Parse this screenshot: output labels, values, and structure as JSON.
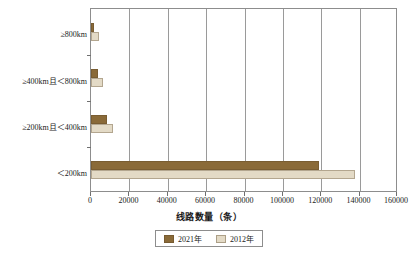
{
  "chart_data": {
    "type": "bar",
    "orientation": "horizontal",
    "title": "",
    "xlabel": "线路数量（条）",
    "ylabel": "",
    "xlim": [
      0,
      160000
    ],
    "xticks": [
      "0",
      "20000",
      "40000",
      "60000",
      "80000",
      "100000",
      "120000",
      "140000",
      "160000"
    ],
    "xtick_values": [
      0,
      20000,
      40000,
      60000,
      80000,
      100000,
      120000,
      140000,
      160000
    ],
    "grid": "vertical",
    "legend_position": "bottom-center",
    "categories": [
      "≥800km",
      "≥400km且＜800km",
      "≥200km且＜400km",
      "＜200km"
    ],
    "series": [
      {
        "name": "2021年",
        "color": "#8a6a38",
        "values": [
          1600,
          3600,
          8300,
          119000
        ]
      },
      {
        "name": "2012年",
        "color": "#e3dac6",
        "values": [
          4200,
          6300,
          11400,
          138000
        ]
      }
    ]
  },
  "axis": {
    "x_title": "线路数量（条）",
    "tick_labels": [
      "0",
      "20000",
      "40000",
      "60000",
      "80000",
      "100000",
      "120000",
      "140000",
      "160000"
    ],
    "category_labels": [
      "≥800km",
      "≥400km且＜800km",
      "≥200km且＜400km",
      "＜200km"
    ]
  },
  "legend": {
    "items": [
      {
        "label": "2021年",
        "color": "#8a6a38"
      },
      {
        "label": "2012年",
        "color": "#e3dac6"
      }
    ]
  },
  "caption": {
    "text": ""
  }
}
